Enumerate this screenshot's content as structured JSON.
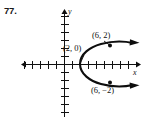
{
  "figure": {
    "problem_number": "77.",
    "axes": {
      "x_label": "x",
      "y_label": "y",
      "origin_px": [
        64,
        64
      ],
      "tick_spacing_px": 8,
      "x_ticks_left": 5,
      "x_ticks_right": 7,
      "y_ticks_up": 6,
      "y_ticks_down": 6,
      "x_axis_from_px": [
        22,
        64
      ],
      "x_axis_to_px": [
        139,
        64
      ],
      "y_axis_from_px": [
        64,
        10
      ],
      "y_axis_to_px": [
        64,
        117
      ]
    },
    "curve": {
      "type": "parabola",
      "opens": "right",
      "vertex": [
        2,
        0
      ],
      "vertex_px": [
        80,
        64
      ],
      "upper_arrow_tip_px": [
        138,
        41
      ],
      "lower_arrow_tip_px": [
        138,
        87
      ]
    },
    "points": [
      {
        "id": "vertex",
        "label": "(2, 0)",
        "x": 2,
        "y": 0,
        "dot_px": [
          80,
          64
        ],
        "dot_visible": false
      },
      {
        "id": "upper-point",
        "label": "(6, 2)",
        "x": 6,
        "y": 2,
        "dot_px": [
          110,
          48
        ],
        "dot_visible": true
      },
      {
        "id": "lower-point",
        "label": "(6, −2)",
        "x": 6,
        "y": -2,
        "dot_px": [
          110,
          80
        ],
        "dot_visible": true
      }
    ],
    "colors": {
      "ink": "#0d0d0d",
      "axis": "#111111",
      "background": "#ffffff"
    }
  }
}
